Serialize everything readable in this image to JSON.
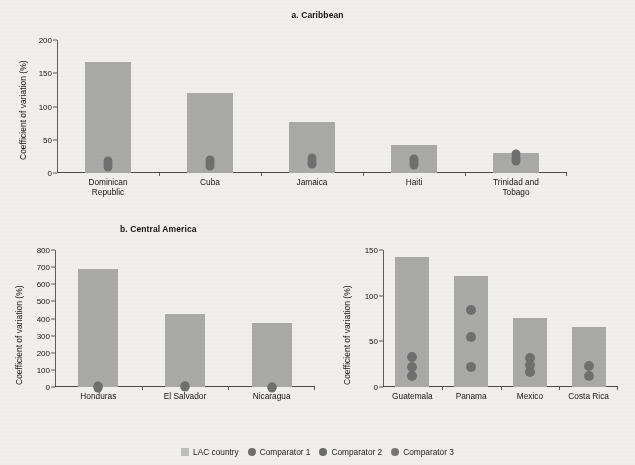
{
  "figure": {
    "background_color": "#f0efed",
    "bar_color": "#a9a9a7",
    "dot_color": "#6f6f6f",
    "axis_color": "#4a4a4a"
  },
  "legend": {
    "items": [
      {
        "label": "LAC country",
        "marker": "square",
        "color": "#bdbdbb"
      },
      {
        "label": "Comparator 1",
        "marker": "circle",
        "color": "#6f6f6f"
      },
      {
        "label": "Comparator 2",
        "marker": "circle",
        "color": "#6a6a6a"
      },
      {
        "label": "Comparator 3",
        "marker": "circle",
        "color": "#757575"
      }
    ]
  },
  "chart_data": [
    {
      "type": "bar",
      "panel_id": "a",
      "title": "a. Caribbean",
      "xlabel": "",
      "ylabel": "Coefficient of variation (%)",
      "ylim": [
        0,
        200
      ],
      "yticks": [
        0,
        50,
        100,
        150,
        200
      ],
      "grid": false,
      "legend_position": "bottom",
      "categories": [
        "Dominican Republic",
        "Cuba",
        "Jamaica",
        "Haiti",
        "Trinidad and Tobago"
      ],
      "values": [
        167,
        121,
        77,
        42,
        30
      ],
      "series": [
        {
          "name": "LAC country",
          "values": [
            167,
            121,
            77,
            42,
            30
          ]
        },
        {
          "name": "Comparator 1",
          "values": [
            25,
            27,
            29,
            28,
            36
          ]
        },
        {
          "name": "Comparator 2",
          "values": [
            20,
            22,
            24,
            23,
            30
          ]
        },
        {
          "name": "Comparator 3",
          "values": [
            16,
            18,
            20,
            19,
            25
          ]
        }
      ]
    },
    {
      "type": "bar",
      "panel_id": "b-left",
      "title": "b. Central America",
      "xlabel": "",
      "ylabel": "Coefficient of variation (%)",
      "ylim": [
        0,
        800
      ],
      "yticks": [
        0,
        100,
        200,
        300,
        400,
        500,
        600,
        700,
        800
      ],
      "grid": false,
      "legend_position": "bottom",
      "categories": [
        "Honduras",
        "El Salvador",
        "Nicaragua"
      ],
      "values": [
        690,
        424,
        374
      ],
      "series": [
        {
          "name": "LAC country",
          "values": [
            690,
            424,
            374
          ]
        },
        {
          "name": "Comparator 1",
          "values": [
            30,
            34,
            28
          ]
        },
        {
          "name": "Comparator 2",
          "values": [
            26,
            30,
            24
          ]
        },
        {
          "name": "Comparator 3",
          "values": [
            22,
            26,
            20
          ]
        }
      ]
    },
    {
      "type": "bar",
      "panel_id": "b-right",
      "title": "",
      "xlabel": "",
      "ylabel": "Coefficient of variation (%)",
      "ylim": [
        0,
        150
      ],
      "yticks": [
        0,
        50,
        100,
        150
      ],
      "grid": false,
      "legend_position": "bottom",
      "categories": [
        "Guatemala",
        "Panama",
        "Mexico",
        "Costa Rica"
      ],
      "values": [
        142,
        122,
        76,
        66
      ],
      "series": [
        {
          "name": "LAC country",
          "values": [
            142,
            122,
            76,
            66
          ]
        },
        {
          "name": "Comparator 1",
          "values": [
            38,
            90,
            37,
            28
          ]
        },
        {
          "name": "Comparator 2",
          "values": [
            27,
            60,
            30,
            18
          ]
        },
        {
          "name": "Comparator 3",
          "values": [
            17,
            27,
            22,
            null
          ]
        }
      ]
    }
  ],
  "panels": {
    "a": {
      "title": "a. Caribbean",
      "ylabel": "Coefficient of variation (%)",
      "yticks": [
        "0",
        "50",
        "100",
        "150",
        "200"
      ],
      "xticks": [
        {
          "line1": "Dominican",
          "line2": "Republic"
        },
        {
          "line1": "Cuba",
          "line2": ""
        },
        {
          "line1": "Jamaica",
          "line2": ""
        },
        {
          "line1": "Haiti",
          "line2": ""
        },
        {
          "line1": "Trinidad and",
          "line2": "Tobago"
        }
      ]
    },
    "b_left": {
      "title": "b. Central America",
      "ylabel": "Coefficient of variation (%)",
      "yticks": [
        "0",
        "100",
        "200",
        "300",
        "400",
        "500",
        "600",
        "700",
        "800"
      ],
      "xticks": [
        {
          "line1": "Honduras",
          "line2": ""
        },
        {
          "line1": "El Salvador",
          "line2": ""
        },
        {
          "line1": "Nicaragua",
          "line2": ""
        }
      ]
    },
    "b_right": {
      "ylabel": "Coefficient of variation (%)",
      "yticks": [
        "0",
        "50",
        "100",
        "150"
      ],
      "xticks": [
        {
          "line1": "Guatemala",
          "line2": ""
        },
        {
          "line1": "Panama",
          "line2": ""
        },
        {
          "line1": "Mexico",
          "line2": ""
        },
        {
          "line1": "Costa Rica",
          "line2": ""
        }
      ]
    }
  }
}
